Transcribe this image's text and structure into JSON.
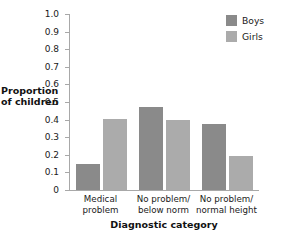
{
  "chart_data": {
    "type": "bar",
    "title": "",
    "xlabel": "Diagnostic category",
    "ylabel": "Proportion of children",
    "ylabel_lines": [
      "Proportion",
      "of children"
    ],
    "categories": [
      "Medical problem",
      "No problem/ below norm",
      "No problem/ normal height"
    ],
    "category_lines": [
      [
        "Medical",
        "problem"
      ],
      [
        "No problem/",
        "below norm"
      ],
      [
        "No problem/",
        "normal height"
      ]
    ],
    "series": [
      {
        "name": "Boys",
        "color": "#8a8a8a",
        "values": [
          0.145,
          0.47,
          0.375
        ]
      },
      {
        "name": "Girls",
        "color": "#ababab",
        "values": [
          0.405,
          0.395,
          0.195
        ]
      }
    ],
    "ylim": [
      0,
      1.0
    ],
    "ytick_values": [
      0,
      0.1,
      0.2,
      0.3,
      0.4,
      0.5,
      0.6,
      0.7,
      0.8,
      0.9,
      1.0
    ],
    "ytick_labels": [
      "0",
      "0.1",
      "0.2",
      "0.3",
      "0.4",
      "0.5",
      "0.6",
      "0.7",
      "0.8",
      "0.9",
      "1.0"
    ],
    "grid": false,
    "legend_position": "top-right",
    "axis_color": "#a8a8a8"
  },
  "legend": {
    "entries": [
      {
        "label": "Boys"
      },
      {
        "label": "Girls"
      }
    ]
  },
  "ghost_title": ""
}
